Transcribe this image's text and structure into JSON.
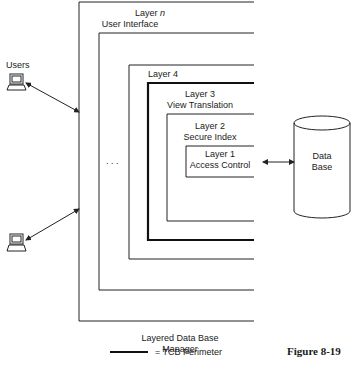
{
  "diagram": {
    "layers": [
      {
        "id": "layer-n",
        "title": "Layer n",
        "title_prefix": "Layer",
        "title_italic": "n",
        "subtitle": "User Interface",
        "tcb": false
      },
      {
        "id": "layer-unnamed",
        "title": "",
        "subtitle": "",
        "tcb": false
      },
      {
        "id": "layer-4",
        "title": "Layer 4",
        "subtitle": "",
        "tcb": false
      },
      {
        "id": "layer-3",
        "title": "Layer 3",
        "subtitle": "View Translation",
        "tcb": true
      },
      {
        "id": "layer-2",
        "title": "Layer 2",
        "subtitle": "Secure Index",
        "tcb": false
      },
      {
        "id": "layer-1",
        "title": "Layer 1",
        "subtitle": "Access Control",
        "tcb": false
      }
    ],
    "ellipsis": ". . .",
    "users_label": "Users",
    "terminal_count": 2,
    "database": {
      "line1": "Data",
      "line2": "Base"
    },
    "manager_label_line1": "Layered Data Base",
    "manager_label_line2": "Manager",
    "legend": {
      "symbol": "thick-line",
      "text": "= TCB Perimeter"
    },
    "figure_label": "Figure 8-19"
  }
}
